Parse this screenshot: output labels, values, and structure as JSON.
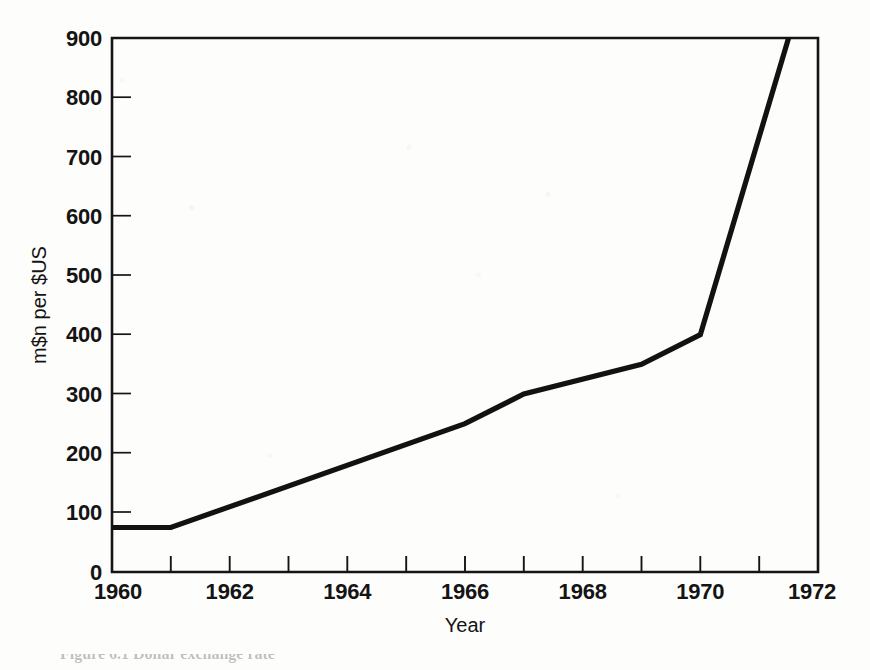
{
  "figure": {
    "background_color": "#fdfdfb",
    "ink_color": "#141414",
    "caption_partial": "Figure 6.1 Dollar exchange rate"
  },
  "chart_data": {
    "type": "line",
    "title": "",
    "subtitle": "",
    "xlabel": "Year",
    "ylabel": "m$n per $US",
    "xlim": [
      1960,
      1972
    ],
    "ylim": [
      0,
      900
    ],
    "grid": false,
    "legend": "none",
    "x_tick_labels": [
      "1960",
      "",
      "1962",
      "",
      "1964",
      "",
      "1966",
      "",
      "1968",
      "",
      "1970",
      "",
      "1972"
    ],
    "x_ticks": [
      1960,
      1961,
      1962,
      1963,
      1964,
      1965,
      1966,
      1967,
      1968,
      1969,
      1970,
      1971,
      1972
    ],
    "x_major_labels": [
      "1960",
      "1962",
      "1964",
      "1966",
      "1968",
      "1970",
      "1972"
    ],
    "x_major_ticks": [
      1960,
      1962,
      1964,
      1966,
      1968,
      1970,
      1972
    ],
    "y_ticks": [
      0,
      100,
      200,
      300,
      400,
      500,
      600,
      700,
      800,
      900
    ],
    "y_tick_labels": [
      "0",
      "100",
      "200",
      "300",
      "400",
      "500",
      "600",
      "700",
      "800",
      "900"
    ],
    "series": [
      {
        "name": "m$n per $US",
        "color": "#121212",
        "x": [
          1960,
          1961,
          1966,
          1967,
          1969,
          1970,
          1971.5
        ],
        "values": [
          75,
          75,
          250,
          300,
          350,
          400,
          900
        ]
      }
    ],
    "annotations": []
  }
}
